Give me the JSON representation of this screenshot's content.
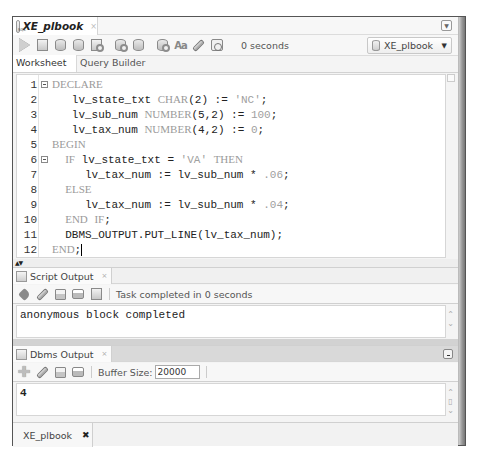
{
  "document_tab": {
    "title": "XE_plbook",
    "close": "×"
  },
  "toolbar": {
    "icons": [
      "run-statement-icon",
      "run-script-icon",
      "commit-icon",
      "rollback-icon",
      "explain-plan-icon",
      "autotrace-icon",
      "sql-tuning-icon",
      "unshared-sql-icon",
      "to-upper-lower-icon",
      "clear-icon",
      "sql-history-icon"
    ],
    "status": "0 seconds",
    "connection": "XE_plbook"
  },
  "subtabs": [
    {
      "label": "Worksheet",
      "active": true
    },
    {
      "label": "Query Builder",
      "active": false
    }
  ],
  "editor": {
    "lines": [
      {
        "n": "1",
        "fold": true
      },
      {
        "n": "2"
      },
      {
        "n": "3"
      },
      {
        "n": "4"
      },
      {
        "n": "5"
      },
      {
        "n": "6",
        "fold": true
      },
      {
        "n": "7"
      },
      {
        "n": "8"
      },
      {
        "n": "9"
      },
      {
        "n": "10"
      },
      {
        "n": "11"
      },
      {
        "n": "12"
      }
    ],
    "code": {
      "l1_kw": "DECLARE",
      "l2_var": "   lv_state_txt ",
      "l2_type": "CHAR",
      "l2_args": "(2) := ",
      "l2_str": "'NC'",
      "l2_end": ";",
      "l3_var": "   lv_sub_num ",
      "l3_type": "NUMBER",
      "l3_args": "(5,2) := ",
      "l3_num": "100",
      "l3_end": ";",
      "l4_var": "   lv_tax_num ",
      "l4_type": "NUMBER",
      "l4_args": "(4,2) := ",
      "l4_num": "0",
      "l4_end": ";",
      "l5_kw": "BEGIN",
      "l6_pre": "  ",
      "l6_kw1": "IF",
      "l6_mid": " lv_state_txt = ",
      "l6_str": "'VA'",
      "l6_sp": " ",
      "l6_kw2": "THEN",
      "l7_code": "     lv_tax_num := lv_sub_num * ",
      "l7_num": ".06",
      "l7_end": ";",
      "l8_pre": "  ",
      "l8_kw": "ELSE",
      "l9_code": "     lv_tax_num := lv_sub_num * ",
      "l9_num": ".04",
      "l9_end": ";",
      "l10_pre": "  ",
      "l10_kw1": "END",
      "l10_sp": " ",
      "l10_kw2": "IF",
      "l10_end": ";",
      "l11_code": "  DBMS_OUTPUT.PUT_LINE(lv_tax_num);",
      "l12_kw": "END",
      "l12_end": ";"
    }
  },
  "splitter": {
    "arrows": "▲▼"
  },
  "script_output": {
    "tab_label": "Script Output",
    "close": "×",
    "toolbar_icons": [
      "pin-icon",
      "clear-icon",
      "save-icon",
      "print-icon",
      "clear-pane-icon"
    ],
    "status": "Task completed in 0 seconds",
    "text": "anonymous block completed"
  },
  "dbms_output": {
    "tab_label": "Dbms Output",
    "close": "×",
    "toolbar_icons": [
      "enable-output-icon",
      "clear-icon",
      "save-icon",
      "print-icon"
    ],
    "buffer_label": "Buffer Size:",
    "buffer_value": "20000",
    "text": "4"
  },
  "bottom_tab": {
    "label": "XE_plbook",
    "close": "✖"
  }
}
